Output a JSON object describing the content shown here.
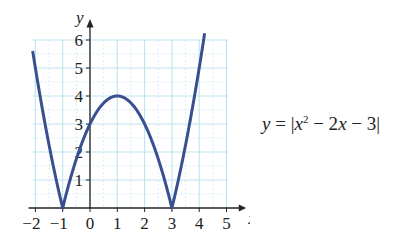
{
  "chart_data": {
    "type": "line",
    "title": "",
    "equation": "y = |x² − 2x − 3|",
    "equation_parts": {
      "lhs": "y",
      "eq": " = ",
      "bar": "|",
      "x": "x",
      "exp": "2",
      "rest": " − 2",
      "x2": "x",
      "tail": " − 3"
    },
    "xlabel": "x",
    "ylabel": "y",
    "xlim": [
      -2.2,
      5.6
    ],
    "ylim": [
      0,
      6.6
    ],
    "x_ticks": [
      -2,
      -1,
      0,
      1,
      2,
      3,
      4,
      5
    ],
    "x_tick_labels": [
      "−2",
      "−1",
      "0",
      "1",
      "2",
      "3",
      "4",
      "5"
    ],
    "y_ticks": [
      1,
      2,
      3,
      4,
      5,
      6
    ],
    "y_tick_labels": [
      "1",
      "2",
      "3",
      "4",
      "5",
      "6"
    ],
    "grid": true,
    "grid_step_minor": 0.5,
    "series": [
      {
        "name": "y = |x^2 - 2x - 3|",
        "x": [
          -2.1,
          -2,
          -1.5,
          -1,
          -0.5,
          0,
          0.5,
          1,
          1.5,
          2,
          2.5,
          3,
          3.5,
          4,
          4.2
        ],
        "y": [
          6.61,
          5,
          2.25,
          0,
          1.75,
          3,
          3.75,
          4,
          3.75,
          3,
          1.75,
          0,
          2.25,
          5,
          6.24
        ]
      }
    ],
    "key_points": [
      {
        "x": -1,
        "y": 0,
        "label": "root"
      },
      {
        "x": 3,
        "y": 0,
        "label": "root"
      },
      {
        "x": 1,
        "y": 4,
        "label": "local maximum"
      },
      {
        "x": 0,
        "y": 3,
        "label": "y-intercept"
      }
    ],
    "colors": {
      "curve": "#3a4f8f",
      "grid": "#bfe3f0",
      "axis": "#222222"
    }
  }
}
